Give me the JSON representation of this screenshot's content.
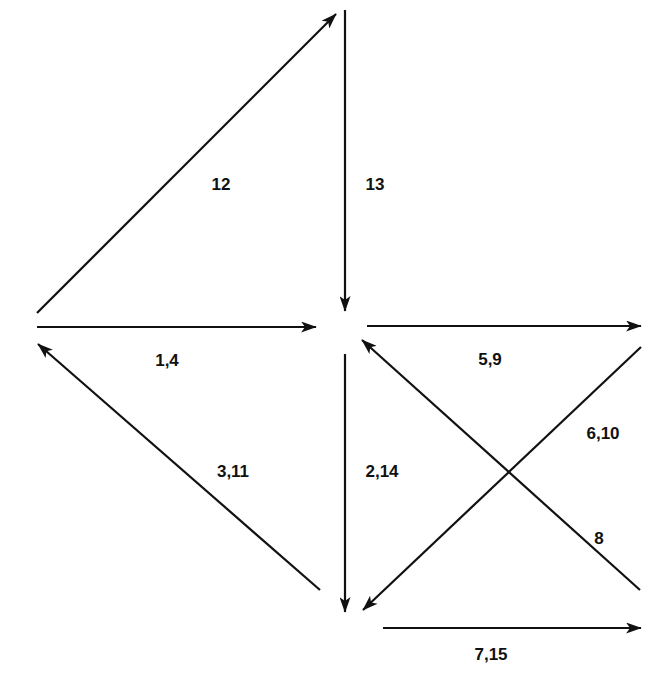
{
  "diagram": {
    "type": "directed-graph",
    "colors": {
      "background": "#ffffff",
      "stroke": "#111111",
      "text": "#111111"
    },
    "nodes": [
      {
        "id": "left",
        "x": 35,
        "y": 325
      },
      {
        "id": "top",
        "x": 345,
        "y": 15
      },
      {
        "id": "center",
        "x": 345,
        "y": 325
      },
      {
        "id": "right",
        "x": 640,
        "y": 325
      },
      {
        "id": "bottom",
        "x": 345,
        "y": 610
      },
      {
        "id": "bottom-right",
        "x": 640,
        "y": 610
      }
    ],
    "edges": [
      {
        "name": "edge-left-to-top",
        "label": "12",
        "x1": 37,
        "y1": 313,
        "x2": 336,
        "y2": 14,
        "lx": 221,
        "ly": 185
      },
      {
        "name": "edge-top-to-center",
        "label": "13",
        "x1": 345,
        "y1": 10,
        "x2": 345,
        "y2": 311,
        "lx": 375,
        "ly": 185
      },
      {
        "name": "edge-left-to-center",
        "label": "1,4",
        "x1": 37,
        "y1": 327,
        "x2": 316,
        "y2": 327,
        "lx": 167,
        "ly": 361
      },
      {
        "name": "edge-center-to-right",
        "label": "5,9",
        "x1": 367,
        "y1": 326,
        "x2": 641,
        "y2": 326,
        "lx": 490,
        "ly": 360
      },
      {
        "name": "edge-bottom-to-left",
        "label": "3,11",
        "x1": 320,
        "y1": 590,
        "x2": 38,
        "y2": 344,
        "lx": 233,
        "ly": 472
      },
      {
        "name": "edge-center-to-bottom",
        "label": "2,14",
        "x1": 345,
        "y1": 354,
        "x2": 345,
        "y2": 612,
        "lx": 382,
        "ly": 472
      },
      {
        "name": "edge-right-to-bottom",
        "label": "6,10",
        "x1": 641,
        "y1": 347,
        "x2": 363,
        "y2": 610,
        "lx": 603,
        "ly": 434
      },
      {
        "name": "edge-bottom-right-to-center",
        "label": "8",
        "x1": 640,
        "y1": 590,
        "x2": 362,
        "y2": 340,
        "lx": 599,
        "ly": 539
      },
      {
        "name": "edge-bottom-to-bottom-right",
        "label": "7,15",
        "x1": 383,
        "y1": 628,
        "x2": 641,
        "y2": 628,
        "lx": 491,
        "ly": 655
      }
    ]
  }
}
